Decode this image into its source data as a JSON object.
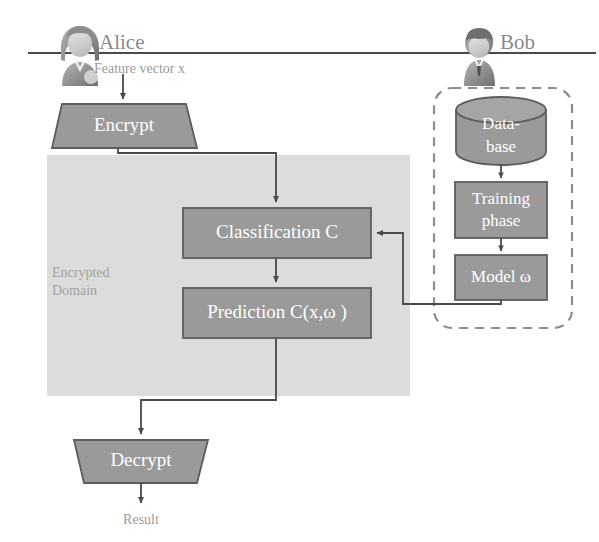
{
  "diagram": {
    "separator": {
      "name": "alice-bob-divider"
    },
    "actors": [
      {
        "id": "alice",
        "label": "Alice",
        "icon": "person-long-hair-icon",
        "caption": "Feature vector x"
      },
      {
        "id": "bob",
        "label": "Bob",
        "icon": "person-short-hair-icon",
        "caption": ""
      }
    ],
    "client_nodes": [
      {
        "id": "encrypt",
        "label": "Encrypt",
        "shape": "trapezoid-down"
      },
      {
        "id": "decrypt",
        "label": "Decrypt",
        "shape": "trapezoid-down"
      }
    ],
    "encrypted_domain": {
      "label_line1": "Encrypted",
      "label_line2": "Domain",
      "nodes": [
        {
          "id": "classification",
          "label": "Classification C",
          "shape": "rect"
        },
        {
          "id": "prediction",
          "label": "Prediction C(x,ω )",
          "shape": "rect"
        }
      ]
    },
    "server_group": {
      "name": "bob-training-group",
      "border": "dashed-rounded",
      "nodes": [
        {
          "id": "database",
          "label_line1": "Data-",
          "label_line2": "base",
          "shape": "cylinder"
        },
        {
          "id": "training",
          "label_line1": "Training",
          "label_line2": "phase",
          "shape": "rect"
        },
        {
          "id": "model",
          "label_line1": "Model ω",
          "label_line2": "",
          "shape": "rect"
        }
      ]
    },
    "output": {
      "id": "result",
      "label": "Result"
    },
    "edges": [
      {
        "from": "feature-vector-x",
        "to": "encrypt"
      },
      {
        "from": "encrypt",
        "to": "classification"
      },
      {
        "from": "classification",
        "to": "prediction"
      },
      {
        "from": "prediction",
        "to": "decrypt"
      },
      {
        "from": "decrypt",
        "to": "result"
      },
      {
        "from": "database",
        "to": "training"
      },
      {
        "from": "training",
        "to": "model"
      },
      {
        "from": "model",
        "to": "classification"
      }
    ],
    "colors": {
      "dark_box_fill": "#9a9a9a",
      "dark_box_stroke": "#5a5a5a",
      "light_panel_fill": "#dcdcdc",
      "line": "#555555",
      "dashed_border": "#8c8c8c",
      "text_gray": "#8a8a8a",
      "box_text": "#ffffff"
    }
  }
}
